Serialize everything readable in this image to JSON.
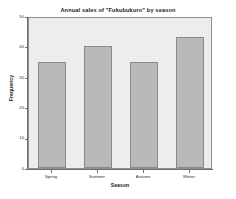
{
  "chart_data": {
    "type": "bar",
    "title": "Annual sales of  \"Fukubukuro\"  by season",
    "xlabel": "Season",
    "ylabel": "Frequency",
    "categories": [
      "Spring",
      "Summer",
      "Autumn",
      "Winter"
    ],
    "values": [
      35,
      40,
      35,
      43
    ],
    "ylim": [
      0,
      50
    ],
    "yticks": [
      0,
      10,
      20,
      30,
      40,
      50
    ],
    "ytick_labels": [
      "0",
      "10",
      "20",
      "30",
      "40",
      "50"
    ],
    "grid": false,
    "legend": "none",
    "colors": {
      "bar_fill": "#b9b9b9",
      "bar_border": "#8a8a8a",
      "panel_background": "#ededed",
      "panel_border": "#8e8e8e",
      "page_background": "#ffffff",
      "axis": "#6f6f6f",
      "text": "#1a1a1a"
    }
  }
}
